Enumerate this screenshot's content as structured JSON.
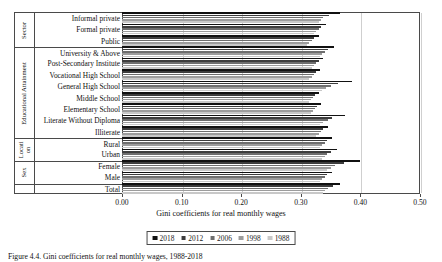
{
  "chart_data": {
    "type": "bar",
    "orientation": "horizontal",
    "title": "",
    "xlabel": "Gini coefficients for real monthly wages",
    "ylabel": "",
    "xlim": [
      0.0,
      0.5
    ],
    "xticks": [
      "0.00",
      "0.10",
      "0.20",
      "0.30",
      "0.40",
      "0.50"
    ],
    "xtick_values": [
      0.0,
      0.1,
      0.2,
      0.3,
      0.4,
      0.5
    ],
    "grid": true,
    "legend_position": "bottom",
    "categories": [
      "Informal private",
      "Formal private",
      "Public",
      "University & Above",
      "Post-Secondary Institute",
      "Vocational High School",
      "General High School",
      "Middle School",
      "Elementary School",
      "Literate Without Diploma",
      "Illiterate",
      "Rural",
      "Urban",
      "Female",
      "Male",
      "Total"
    ],
    "groups": [
      {
        "label": "Sector",
        "count": 3
      },
      {
        "label": "Educational Attainment",
        "count": 8
      },
      {
        "label": "Locati on",
        "count": 2
      },
      {
        "label": "Sex",
        "count": 2
      },
      {
        "label": "",
        "count": 1
      }
    ],
    "series": [
      {
        "name": "2018",
        "color": "#111111",
        "values": [
          0.365,
          0.342,
          0.33,
          0.355,
          0.338,
          0.332,
          0.386,
          0.33,
          0.334,
          0.374,
          0.345,
          0.352,
          0.36,
          0.4,
          0.352,
          0.366
        ]
      },
      {
        "name": "2012",
        "color": "#3d3d3d",
        "values": [
          0.348,
          0.334,
          0.322,
          0.345,
          0.33,
          0.326,
          0.362,
          0.324,
          0.328,
          0.352,
          0.338,
          0.344,
          0.35,
          0.372,
          0.344,
          0.354
        ]
      },
      {
        "name": "2006",
        "color": "#6e6e6e",
        "values": [
          0.338,
          0.33,
          0.318,
          0.34,
          0.326,
          0.322,
          0.35,
          0.32,
          0.324,
          0.345,
          0.334,
          0.34,
          0.344,
          0.358,
          0.34,
          0.346
        ]
      },
      {
        "name": "1998",
        "color": "#9c9c9c",
        "values": [
          0.334,
          0.326,
          0.314,
          0.336,
          0.322,
          0.318,
          0.342,
          0.317,
          0.32,
          0.338,
          0.33,
          0.336,
          0.34,
          0.35,
          0.336,
          0.341
        ]
      },
      {
        "name": "1988",
        "color": "#c8c8c8",
        "values": [
          0.33,
          0.322,
          0.31,
          0.332,
          0.318,
          0.314,
          0.336,
          0.313,
          0.317,
          0.333,
          0.326,
          0.332,
          0.336,
          0.344,
          0.332,
          0.337
        ]
      }
    ]
  },
  "caption": {
    "text": "Figure 4.4. Gini coefficients for real monthly wages, 1988-2018"
  }
}
